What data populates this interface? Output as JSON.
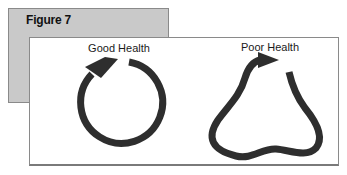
{
  "figure": {
    "label": "Figure 7",
    "panels": [
      {
        "caption": "Good Health",
        "shape": "circular-arrow"
      },
      {
        "caption": "Poor Health",
        "shape": "distorted-loop-arrow"
      }
    ]
  },
  "colors": {
    "back_panel": "#c9c9c9",
    "border": "#8a8a8a",
    "stroke": "#2e2e2e"
  }
}
